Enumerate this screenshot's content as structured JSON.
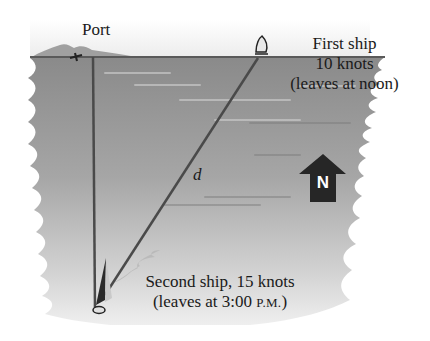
{
  "diagram": {
    "port_label": "Port",
    "first_ship": {
      "line1": "First ship",
      "line2": "10 knots",
      "line3": "(leaves at noon)",
      "direction": "east"
    },
    "second_ship": {
      "line1": "Second ship, 15 knots",
      "line2_prefix": "(leaves at 3:00 ",
      "line2_time_suffix": "P.M.",
      "line2_close": ")",
      "direction": "south"
    },
    "distance_label": "d",
    "compass": {
      "letter": "N",
      "icon": "north-arrow-icon"
    },
    "colors": {
      "water_dark": "#8c8c8c",
      "water_light": "#d9d9d9",
      "lines": "#4a4a4a",
      "arrow": "#262626",
      "text": "#1a1a1a"
    }
  }
}
